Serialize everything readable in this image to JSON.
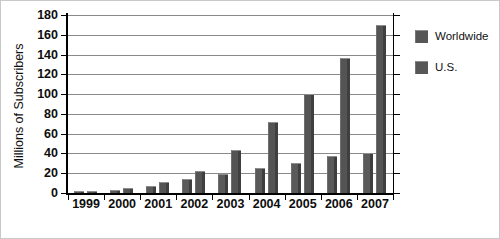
{
  "chart_data": {
    "type": "bar",
    "title": "",
    "xlabel": "",
    "ylabel": "Millions of Subscribers",
    "ylim": [
      0,
      180
    ],
    "yticks": [
      0,
      20,
      40,
      60,
      80,
      100,
      120,
      140,
      160,
      180
    ],
    "grid": true,
    "legend_position": "right",
    "categories": [
      "1999",
      "2000",
      "2001",
      "2002",
      "2003",
      "2004",
      "2005",
      "2006",
      "2007"
    ],
    "series": [
      {
        "name": "Worldwide",
        "color": "#5a5a5a",
        "values": [
          1,
          3,
          7,
          14,
          19,
          25,
          30,
          37,
          40
        ]
      },
      {
        "name": "U.S.",
        "color": "#545454",
        "values": [
          2,
          5,
          11,
          22,
          43,
          72,
          100,
          137,
          170
        ]
      }
    ]
  },
  "legend": {
    "items": [
      {
        "label": "Worldwide"
      },
      {
        "label": "U.S."
      }
    ]
  }
}
